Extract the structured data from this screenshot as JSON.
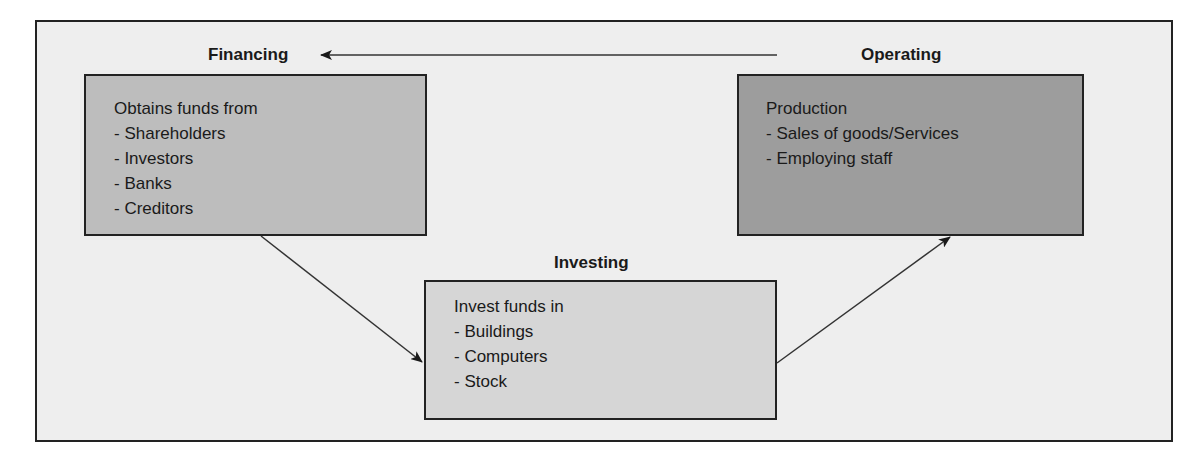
{
  "diagram": {
    "type": "cycle",
    "nodes": {
      "financing": {
        "heading": "Financing",
        "lines": [
          "Obtains funds from",
          "- Shareholders",
          "- Investors",
          "- Banks",
          "- Creditors"
        ],
        "fill": "#bdbdbd"
      },
      "operating": {
        "heading": "Operating",
        "lines": [
          "Production",
          "- Sales of goods/Services",
          "- Employing staff"
        ],
        "fill": "#9d9d9d"
      },
      "investing": {
        "heading": "Investing",
        "lines": [
          "Invest funds in",
          "- Buildings",
          "- Computers",
          "- Stock"
        ],
        "fill": "#d6d6d6"
      }
    },
    "edges": [
      {
        "from": "operating",
        "to": "financing"
      },
      {
        "from": "financing",
        "to": "investing"
      },
      {
        "from": "investing",
        "to": "operating"
      }
    ],
    "colors": {
      "background": "#eeeeee",
      "border": "#222222"
    }
  }
}
